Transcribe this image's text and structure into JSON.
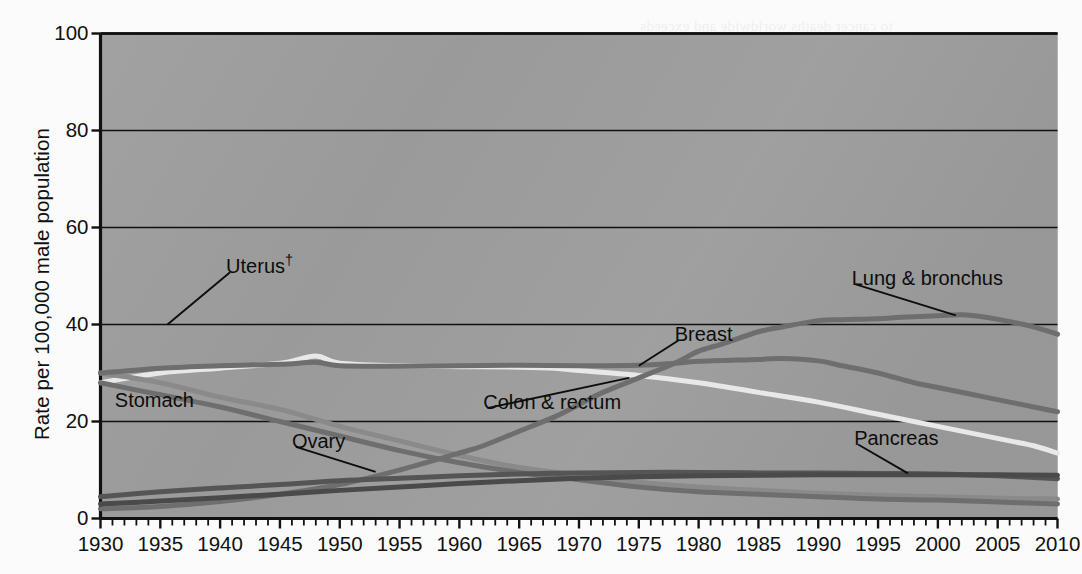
{
  "chart_data": {
    "type": "line",
    "title": "",
    "subtitle": "",
    "xlabel": "",
    "ylabel": "Rate per 100,000 male population",
    "xlim": [
      1930,
      2010
    ],
    "ylim": [
      0,
      100
    ],
    "yticks": [
      0,
      20,
      40,
      60,
      80,
      100
    ],
    "xticks": [
      1930,
      1935,
      1940,
      1945,
      1950,
      1955,
      1960,
      1965,
      1970,
      1975,
      1980,
      1985,
      1990,
      1995,
      2000,
      2005,
      2010
    ],
    "minor_x_step": 1,
    "grid": "horizontal",
    "legend": "inline-annotations",
    "plot_background": "#9c9c9c",
    "series": [
      {
        "name": "Lung & bronchus",
        "label": "Lung & bronchus",
        "color": "#6e6e6e",
        "width": 5,
        "x": [
          1930,
          1935,
          1940,
          1945,
          1950,
          1955,
          1960,
          1962,
          1965,
          1968,
          1970,
          1972,
          1975,
          1978,
          1980,
          1982,
          1985,
          1987,
          1990,
          1992,
          1995,
          1997,
          2000,
          2002,
          2004,
          2006,
          2008,
          2010
        ],
        "values": [
          2,
          2.5,
          3.5,
          5,
          7,
          10,
          13.5,
          15,
          18,
          21,
          23.5,
          26,
          29,
          32,
          34.5,
          36,
          38.5,
          39.5,
          40.8,
          41,
          41.2,
          41.5,
          41.8,
          42,
          41.5,
          40.6,
          39.5,
          38
        ]
      },
      {
        "name": "Breast",
        "label": "Breast",
        "color": "#6e6e6e",
        "width": 5,
        "x": [
          1930,
          1935,
          1940,
          1945,
          1948,
          1950,
          1955,
          1960,
          1965,
          1970,
          1975,
          1978,
          1980,
          1985,
          1987,
          1990,
          1992,
          1995,
          1998,
          2000,
          2003,
          2006,
          2008,
          2010
        ],
        "values": [
          30,
          31,
          31.5,
          31.8,
          32.2,
          31.5,
          31.4,
          31.5,
          31.6,
          31.5,
          31.6,
          32,
          32.4,
          32.8,
          33,
          32.5,
          31.5,
          30,
          28,
          27,
          25.5,
          24,
          23,
          22
        ]
      },
      {
        "name": "Colon & rectum",
        "label": "Colon & rectum",
        "color": "#e8e8e8",
        "width": 5,
        "x": [
          1930,
          1935,
          1940,
          1945,
          1948,
          1950,
          1955,
          1960,
          1965,
          1968,
          1970,
          1975,
          1980,
          1985,
          1990,
          1995,
          2000,
          2003,
          2006,
          2008,
          2010
        ],
        "values": [
          28,
          30,
          31,
          32,
          33.5,
          32,
          31.5,
          31.3,
          31.2,
          31,
          30.5,
          29.5,
          28,
          26,
          24,
          21.5,
          19,
          17.5,
          16,
          15,
          13.5
        ]
      },
      {
        "name": "Uterus",
        "label": "Uterus†",
        "color": "#8a8a8a",
        "width": 5,
        "x": [
          1930,
          1935,
          1940,
          1945,
          1950,
          1955,
          1960,
          1965,
          1970,
          1975,
          1980,
          1985,
          1990,
          1995,
          2000,
          2005,
          2010
        ],
        "values": [
          30,
          28,
          25,
          22.5,
          19,
          16,
          13,
          10.5,
          9,
          7.5,
          6.5,
          5.8,
          5.2,
          4.8,
          4.5,
          4.2,
          4
        ]
      },
      {
        "name": "Stomach",
        "label": "Stomach",
        "color": "#6e6e6e",
        "width": 5,
        "x": [
          1930,
          1935,
          1940,
          1945,
          1950,
          1955,
          1960,
          1965,
          1970,
          1975,
          1980,
          1985,
          1990,
          1995,
          2000,
          2005,
          2010
        ],
        "values": [
          28,
          25.5,
          23,
          20,
          17,
          14,
          11.5,
          9.5,
          8,
          6.5,
          5.5,
          5,
          4.5,
          4,
          3.8,
          3.4,
          3
        ]
      },
      {
        "name": "Ovary",
        "label": "Ovary",
        "color": "#555555",
        "width": 5,
        "x": [
          1930,
          1935,
          1940,
          1945,
          1950,
          1955,
          1960,
          1965,
          1970,
          1975,
          1980,
          1985,
          1990,
          1995,
          2000,
          2005,
          2010
        ],
        "values": [
          4.5,
          5.5,
          6.3,
          7,
          7.8,
          8.3,
          8.8,
          9.2,
          9.4,
          9.5,
          9.5,
          9.4,
          9.4,
          9.3,
          9.2,
          8.8,
          8.2
        ]
      },
      {
        "name": "Pancreas",
        "label": "Pancreas",
        "color": "#4a4a4a",
        "width": 5,
        "x": [
          1930,
          1935,
          1940,
          1945,
          1950,
          1955,
          1960,
          1965,
          1970,
          1975,
          1980,
          1985,
          1990,
          1995,
          2000,
          2005,
          2010
        ],
        "values": [
          3,
          3.6,
          4.3,
          5,
          5.8,
          6.5,
          7.2,
          7.8,
          8.3,
          8.6,
          8.8,
          8.9,
          9,
          9,
          9,
          9,
          8.9
        ]
      }
    ],
    "annotations": [
      {
        "id": "uterus",
        "text": "Uterus†",
        "x": 1940.5,
        "y": 52.0,
        "leader": {
          "to_x": 1935.6,
          "to_y": 40.0
        }
      },
      {
        "id": "stomach",
        "text": "Stomach",
        "x": 1931.2,
        "y": 24.5,
        "leader": null
      },
      {
        "id": "ovary",
        "text": "Ovary",
        "x": 1946.0,
        "y": 16.0,
        "leader": {
          "to_x": 1953.0,
          "to_y": 9.6
        }
      },
      {
        "id": "colon-rectum",
        "text": "Colon & rectum",
        "x": 1962.0,
        "y": 24.0,
        "leader": {
          "to_x": 1974.2,
          "to_y": 29.0
        }
      },
      {
        "id": "breast",
        "text": "Breast",
        "x": 1978.0,
        "y": 38.0,
        "leader": {
          "to_x": 1975.0,
          "to_y": 31.5
        }
      },
      {
        "id": "lung-bronchus",
        "text": "Lung & bronchus",
        "x": 1992.8,
        "y": 49.5,
        "leader": {
          "to_x": 2001.5,
          "to_y": 41.9
        }
      },
      {
        "id": "pancreas",
        "text": "Pancreas",
        "x": 1993.0,
        "y": 16.5,
        "leader": {
          "to_x": 1997.5,
          "to_y": 9.3
        }
      }
    ]
  },
  "axis": {
    "y_title": "Rate per 100,000 male population",
    "y_tick_labels": [
      "100",
      "80",
      "60",
      "40",
      "20",
      "0"
    ],
    "x_tick_labels": [
      "1930",
      "1935",
      "1940",
      "1945",
      "1950",
      "1955",
      "1960",
      "1965",
      "1970",
      "1975",
      "1980",
      "1985",
      "1990",
      "1995",
      "2000",
      "2005",
      "2010"
    ]
  },
  "annotation_labels": {
    "uterus": "Uterus",
    "uterus_dagger": "†",
    "stomach": "Stomach",
    "ovary": "Ovary",
    "colon_rectum": "Colon & rectum",
    "breast": "Breast",
    "lung_bronchus": "Lung & bronchus",
    "pancreas": "Pancreas"
  },
  "page_bleed": [
    {
      "text": "to cancer deaths worldwide and exceeds",
      "x": 640,
      "y": 18
    },
    {
      "text": "and the etiology of several cancers",
      "x": 640,
      "y": 92
    },
    {
      "text": "relatives, and mice Centers for Disease",
      "x": 640,
      "y": 116
    },
    {
      "text": "suggests that risks are more easily",
      "x": 640,
      "y": 140
    },
    {
      "text": "reduce the years of life lost to cancer",
      "x": 640,
      "y": 164
    },
    {
      "text": "incidence and mortality in the United",
      "x": 640,
      "y": 188
    },
    {
      "text": "rates are rising in much of the world",
      "x": 640,
      "y": 212
    },
    {
      "text": "initiatives for cancer prevention and",
      "x": 640,
      "y": 292
    },
    {
      "text": "control in developing nations remain",
      "x": 640,
      "y": 316
    },
    {
      "text": "per capita tobacco consumption has",
      "x": 640,
      "y": 392
    },
    {
      "text": "fallen steadily since the mid-1960s",
      "x": 640,
      "y": 416
    }
  ]
}
